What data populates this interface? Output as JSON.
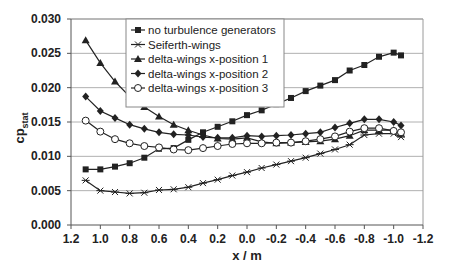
{
  "chart_data": {
    "type": "line",
    "title": "",
    "xlabel": "x / m",
    "ylabel": "cp_stat",
    "ylabel_main": "cp",
    "ylabel_sub": "stat",
    "xlim": [
      1.2,
      -1.2
    ],
    "ylim": [
      0.0,
      0.03
    ],
    "x_reversed": true,
    "grid": {
      "horizontal": true,
      "vertical": false
    },
    "legend_position": "top-center-inside",
    "x_ticks": [
      1.2,
      1.0,
      0.8,
      0.6,
      0.4,
      0.2,
      0.0,
      -0.2,
      -0.4,
      -0.6,
      -0.8,
      -1.0,
      -1.2
    ],
    "x_tick_labels": [
      "1.2",
      "1.0",
      "0.8",
      "0.6",
      "0.4",
      "0.2",
      "0.0",
      "-0.2",
      "-0.4",
      "-0.6",
      "-0.8",
      "-1.0",
      "-1.2"
    ],
    "y_ticks": [
      0.0,
      0.005,
      0.01,
      0.015,
      0.02,
      0.025,
      0.03
    ],
    "y_tick_labels": [
      "0.000",
      "0.005",
      "0.010",
      "0.015",
      "0.020",
      "0.025",
      "0.030"
    ],
    "x": [
      1.1,
      1.0,
      0.9,
      0.8,
      0.7,
      0.6,
      0.5,
      0.4,
      0.3,
      0.2,
      0.1,
      0.0,
      -0.1,
      -0.2,
      -0.3,
      -0.4,
      -0.5,
      -0.6,
      -0.7,
      -0.8,
      -0.9,
      -1.0,
      -1.05
    ],
    "series": [
      {
        "name": "no turbulence generators",
        "marker": "square-filled",
        "values": [
          0.0081,
          0.0081,
          0.0085,
          0.009,
          0.0098,
          0.0111,
          0.0112,
          0.0124,
          0.0135,
          0.0143,
          0.0151,
          0.016,
          0.0167,
          0.0176,
          0.0185,
          0.0195,
          0.0203,
          0.0211,
          0.0225,
          0.0233,
          0.0245,
          0.0251,
          0.0247
        ]
      },
      {
        "name": "Seiferth-wings",
        "marker": "star",
        "values": [
          0.0065,
          0.005,
          0.0048,
          0.0046,
          0.0047,
          0.0051,
          0.0052,
          0.0055,
          0.0061,
          0.0066,
          0.0072,
          0.0077,
          0.0083,
          0.0088,
          0.0093,
          0.0098,
          0.0104,
          0.011,
          0.0117,
          0.0131,
          0.0133,
          0.0133,
          0.0128
        ]
      },
      {
        "name": "delta-wings x-position 1",
        "marker": "triangle-filled",
        "values": [
          0.0269,
          0.0236,
          0.0209,
          0.0187,
          0.0172,
          0.0158,
          0.0146,
          0.0138,
          0.0131,
          0.0126,
          0.0125,
          0.0127,
          0.0121,
          0.0119,
          0.012,
          0.0121,
          0.0122,
          0.0125,
          0.013,
          0.0138,
          0.0138,
          0.0138,
          0.0133
        ]
      },
      {
        "name": "delta-wings x-position 2",
        "marker": "diamond-filled",
        "values": [
          0.0187,
          0.0166,
          0.0156,
          0.0146,
          0.014,
          0.0135,
          0.0132,
          0.0131,
          0.0128,
          0.0127,
          0.0127,
          0.013,
          0.0129,
          0.013,
          0.0131,
          0.0133,
          0.0135,
          0.0142,
          0.0148,
          0.0154,
          0.0154,
          0.015,
          0.0145
        ]
      },
      {
        "name": "delta-wings x-position 3",
        "marker": "circle-open",
        "values": [
          0.0152,
          0.0136,
          0.0125,
          0.0119,
          0.0115,
          0.0113,
          0.011,
          0.0109,
          0.0112,
          0.0115,
          0.0118,
          0.0119,
          0.0119,
          0.012,
          0.012,
          0.0122,
          0.0125,
          0.0129,
          0.0136,
          0.0141,
          0.0141,
          0.0137,
          0.0135
        ]
      }
    ]
  },
  "legend": {
    "items": [
      {
        "label": "no turbulence generators",
        "marker": "square-filled"
      },
      {
        "label": "Seiferth-wings",
        "marker": "star"
      },
      {
        "label": "delta-wings x-position 1",
        "marker": "triangle-filled"
      },
      {
        "label": "delta-wings x-position 2",
        "marker": "diamond-filled"
      },
      {
        "label": "delta-wings x-position 3",
        "marker": "circle-open"
      }
    ]
  },
  "colors": {
    "line": "#222222",
    "grid": "#b0b0b0",
    "frame": "#9a9a9a",
    "background": "#ffffff"
  }
}
